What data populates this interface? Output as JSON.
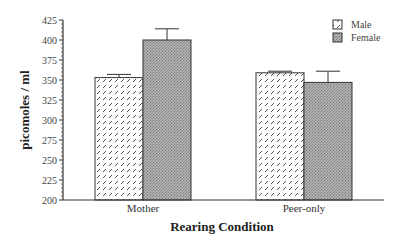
{
  "chart_data": {
    "type": "bar",
    "title": "",
    "xlabel": "Rearing Condition",
    "ylabel": "picomoles / ml",
    "ylim": [
      200,
      425
    ],
    "yticks": [
      200,
      225,
      250,
      275,
      300,
      325,
      350,
      375,
      400,
      425
    ],
    "categories": [
      "Mother",
      "Peer-only"
    ],
    "series": [
      {
        "name": "Male",
        "values": [
          353,
          359
        ],
        "error": [
          4,
          2
        ],
        "fill": "hatched",
        "color": "#ffffff"
      },
      {
        "name": "Female",
        "values": [
          400,
          347
        ],
        "error": [
          14,
          14
        ],
        "fill": "stippled",
        "color": "#a6a6a6"
      }
    ],
    "grid": false,
    "legend_position": "top-right"
  }
}
